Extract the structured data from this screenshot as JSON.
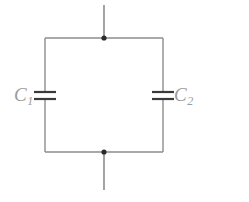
{
  "figure": {
    "kind": "circuit-diagram",
    "background_color": "#ffffff",
    "wire_color": "#8d8d8d",
    "element_color": "#3a3a3a",
    "node_color": "#2b2b2b",
    "label_color": "#9b9b9b",
    "width": 249,
    "height": 202
  },
  "components": {
    "capacitor_left": {
      "label": "C",
      "subscript": "1",
      "label_full": "C1",
      "position": "left-branch"
    },
    "capacitor_right": {
      "label": "C",
      "subscript": "2",
      "label_full": "C2",
      "position": "right-branch"
    }
  },
  "nodes": {
    "top": {
      "name": "top-junction",
      "x": 104,
      "y": 38
    },
    "bottom": {
      "name": "bottom-junction",
      "x": 104,
      "y": 152
    }
  },
  "terminals": {
    "top": {
      "name": "top-terminal-lead",
      "x": 104,
      "y_start": 5,
      "y_end": 38
    },
    "bottom": {
      "name": "bottom-terminal-lead",
      "x": 104,
      "y_start": 152,
      "y_end": 190
    }
  },
  "loop": {
    "left_x": 45,
    "right_x": 163,
    "top_y": 38,
    "bottom_y": 152
  }
}
